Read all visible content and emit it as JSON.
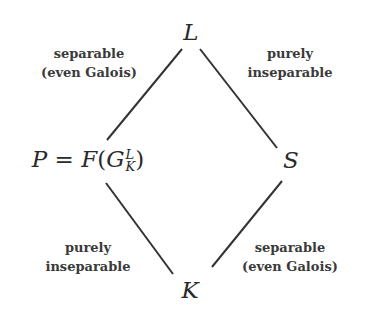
{
  "diagram": {
    "type": "field-extension-lattice",
    "nodes": {
      "top": {
        "label": "L"
      },
      "left": {
        "lhs": "P",
        "equals": "=",
        "func": "F",
        "open": "(",
        "base": "G",
        "sup": "L",
        "sub": "K",
        "close": ")"
      },
      "right": {
        "label": "S"
      },
      "bottom": {
        "label": "K"
      }
    },
    "edges": [
      {
        "from": "left",
        "to": "top",
        "label_lines": [
          "separable",
          "(even Galois)"
        ]
      },
      {
        "from": "right",
        "to": "top",
        "label_lines": [
          "purely",
          "inseparable"
        ]
      },
      {
        "from": "bottom",
        "to": "left",
        "label_lines": [
          "purely",
          "inseparable"
        ]
      },
      {
        "from": "bottom",
        "to": "right",
        "label_lines": [
          "separable",
          "(even Galois)"
        ]
      }
    ],
    "colors": {
      "line": "#333333",
      "text": "#2a2a2a",
      "background": "#ffffff"
    }
  }
}
